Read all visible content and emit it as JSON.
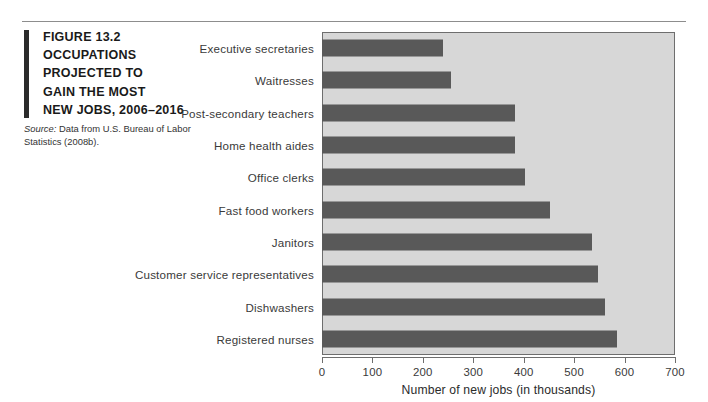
{
  "figure": {
    "label": "FIGURE",
    "number": "13.2",
    "title_lines": [
      "OCCUPATIONS",
      "PROJECTED TO",
      "GAIN THE MOST",
      "NEW JOBS, 2006–2016"
    ],
    "source_lead": "Source:",
    "source_text": " Data from U.S. Bureau of Labor Statistics (2008b)."
  },
  "colors": {
    "bar": "#595959",
    "plot_background": "#d7d7d7",
    "plot_border": "#6e6e6e",
    "caption_bar": "#2b2b2b",
    "text": "#3a3a3a"
  },
  "chart_data": {
    "type": "bar",
    "orientation": "horizontal",
    "title": "",
    "categories": [
      "Executive secretaries",
      "Waitresses",
      "Post-secondary teachers",
      "Home health aides",
      "Office clerks",
      "Fast food workers",
      "Janitors",
      "Customer service representatives",
      "Dishwashers",
      "Registered nurses"
    ],
    "values": [
      239,
      255,
      383,
      383,
      403,
      453,
      535,
      547,
      562,
      584
    ],
    "xlabel": "Number of new jobs (in thousands)",
    "ylabel": "",
    "xlim": [
      0,
      700
    ],
    "xticks": [
      0,
      100,
      200,
      300,
      400,
      500,
      600,
      700
    ],
    "xtick_labels": [
      "0",
      "100",
      "200",
      "300",
      "400",
      "500",
      "600",
      "700"
    ],
    "grid": false,
    "legend": false
  }
}
